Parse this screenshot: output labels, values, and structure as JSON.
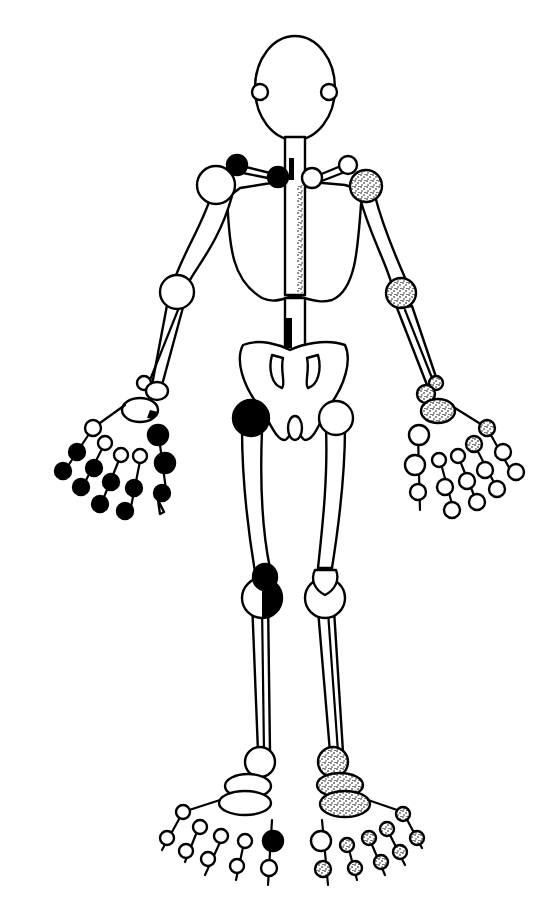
{
  "diagram": {
    "type": "joint-homunculus",
    "legend_fills": {
      "normal": "open circle (uninvolved)",
      "solid": "solid black (involved, right side)",
      "stipple": "stippled (involved, left side)"
    },
    "colors": {
      "ink": "#000000",
      "paper": "#ffffff"
    },
    "joints": [
      {
        "id": "tmj-right",
        "state": "normal"
      },
      {
        "id": "tmj-left",
        "state": "normal"
      },
      {
        "id": "acromioclavicular-right",
        "state": "solid"
      },
      {
        "id": "sternoclavicular-right",
        "state": "solid"
      },
      {
        "id": "sternoclavicular-left",
        "state": "normal"
      },
      {
        "id": "acromioclavicular-left",
        "state": "normal"
      },
      {
        "id": "shoulder-right",
        "state": "normal"
      },
      {
        "id": "shoulder-left",
        "state": "stipple"
      },
      {
        "id": "elbow-right",
        "state": "normal"
      },
      {
        "id": "elbow-left",
        "state": "stipple"
      },
      {
        "id": "wrist-right",
        "state": "normal"
      },
      {
        "id": "wrist-left",
        "state": "stipple"
      },
      {
        "id": "hip-right",
        "state": "solid"
      },
      {
        "id": "hip-left",
        "state": "normal"
      },
      {
        "id": "knee-right",
        "state": "half-solid"
      },
      {
        "id": "knee-left",
        "state": "normal"
      },
      {
        "id": "ankle-right",
        "state": "normal"
      },
      {
        "id": "ankle-left",
        "state": "stipple"
      },
      {
        "id": "cervical-spine",
        "state": "solid-bar"
      },
      {
        "id": "thoracic-spine",
        "state": "stipple-bar"
      },
      {
        "id": "lumbar-spine",
        "state": "solid-bar"
      },
      {
        "id": "right-hand-mcp",
        "state": "mixed: thumb solid, others normal"
      },
      {
        "id": "right-hand-pip",
        "state": "solid"
      },
      {
        "id": "right-hand-dip",
        "state": "solid"
      },
      {
        "id": "left-hand-mcp",
        "state": "index & middle stipple, others normal"
      },
      {
        "id": "left-hand-pip",
        "state": "normal"
      },
      {
        "id": "left-hand-dip",
        "state": "normal"
      },
      {
        "id": "right-foot-mtp",
        "state": "great toe solid, others normal"
      },
      {
        "id": "right-foot-ip",
        "state": "normal"
      },
      {
        "id": "left-foot-mtp",
        "state": "great toe normal, others stipple"
      },
      {
        "id": "left-foot-ip",
        "state": "stipple"
      },
      {
        "id": "left-tarsal",
        "state": "stipple"
      }
    ]
  }
}
